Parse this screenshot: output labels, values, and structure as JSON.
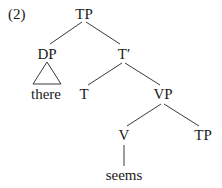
{
  "example_number": "(2)",
  "tree": {
    "root": {
      "label": "TP"
    },
    "dp": {
      "label": "DP",
      "content": "there"
    },
    "tbar": {
      "label": "T′"
    },
    "t": {
      "label": "T"
    },
    "vp": {
      "label": "VP"
    },
    "v": {
      "label": "V",
      "word": "seems"
    },
    "tp_lower": {
      "label": "TP"
    }
  },
  "colors": {
    "text": "#1a1a1a",
    "lines": "#3a3a3a",
    "background": "#ffffff"
  }
}
